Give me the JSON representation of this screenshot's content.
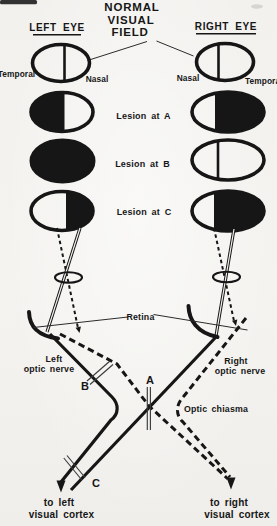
{
  "figure": {
    "title_lines": [
      "NORMAL",
      "VISUAL",
      "FIELD"
    ],
    "left_column_header": "LEFT EYE",
    "right_column_header": "RIGHT EYE",
    "normal_row": {
      "left_eye": {
        "outer_label": "Temporal",
        "inner_label": "Nasal",
        "appearance": "clear field with vertical divider"
      },
      "right_eye": {
        "inner_label": "Nasal",
        "outer_label": "Temporal",
        "appearance": "clear field with vertical divider"
      }
    },
    "lesion_rows": [
      {
        "label": "Lesion at A",
        "left_eye_dark_half": "temporal (left) half black",
        "right_eye_dark_half": "temporal (right) half black"
      },
      {
        "label": "Lesion at B",
        "left_eye_dark_half": "entire field black",
        "right_eye_dark_half": "none (clear with divider)"
      },
      {
        "label": "Lesion at C",
        "left_eye_dark_half": "nasal (right) half black",
        "right_eye_dark_half": "temporal (right) half black"
      }
    ],
    "pathway": {
      "retina_label": "Retina",
      "left_nerve_lines": [
        "Left",
        "optic nerve"
      ],
      "right_nerve_lines": [
        "Right",
        "optic nerve"
      ],
      "chiasm_label": "Optic chiasma",
      "marker_a": "A",
      "marker_b": "B",
      "marker_c": "C",
      "left_cortex_lines": [
        "to left",
        "visual cortex"
      ],
      "right_cortex_lines": [
        "to right",
        "visual cortex"
      ]
    },
    "colors": {
      "ink": "#161616",
      "paper": "#f2f1ee"
    }
  }
}
